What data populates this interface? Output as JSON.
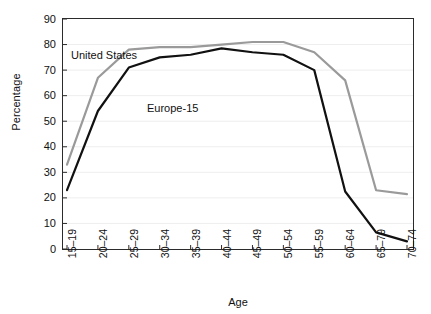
{
  "chart_data": {
    "type": "line",
    "title": "",
    "subtitle": "",
    "xlabel": "Age",
    "ylabel": "Percentage",
    "categories": [
      "15–19",
      "20–24",
      "25–29",
      "30–34",
      "35–39",
      "40–44",
      "45–49",
      "50–54",
      "55–59",
      "60–64",
      "65–79",
      "70–74"
    ],
    "yticks": [
      90,
      80,
      70,
      60,
      50,
      40,
      30,
      20,
      10,
      0
    ],
    "ylim": [
      0,
      90
    ],
    "grid": "horizontal",
    "legend_position": "inline-annotations",
    "series": [
      {
        "name": "United States",
        "color": "#9a9a9a",
        "values": [
          33,
          67,
          78,
          79,
          79,
          80,
          81,
          81,
          77,
          66,
          23,
          21.5
        ]
      },
      {
        "name": "Europe-15",
        "color": "#111111",
        "values": [
          23,
          54,
          71,
          75,
          76,
          78.5,
          77,
          76,
          70,
          22.5,
          6.5,
          3
        ]
      }
    ],
    "annotations": [
      {
        "text": "United States",
        "series": "United States"
      },
      {
        "text": "Europe-15",
        "series": "Europe-15"
      }
    ]
  },
  "axes": {
    "y_title": "Percentage",
    "x_title": "Age",
    "y_tick_labels": [
      "90",
      "80",
      "70",
      "60",
      "50",
      "40",
      "30",
      "20",
      "10",
      "0"
    ],
    "x_tick_labels": [
      "15–19",
      "20–24",
      "25–29",
      "30–34",
      "35–39",
      "40–44",
      "45–49",
      "50–54",
      "55–59",
      "60–64",
      "65–79",
      "70–74"
    ]
  },
  "colors": {
    "united_states_line": "#9a9a9a",
    "europe_line": "#111111",
    "axis": "#2b2b2b",
    "grid": "#eeeeee",
    "background": "#ffffff"
  }
}
